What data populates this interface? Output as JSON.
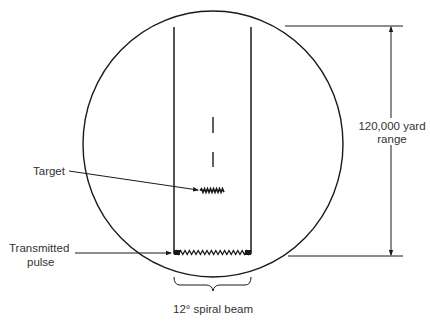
{
  "diagram": {
    "labels": {
      "target": "Target",
      "transmitted_pulse_line1": "Transmitted",
      "transmitted_pulse_line2": "pulse",
      "range_line1": "120,000 yard",
      "range_line2": "range",
      "beam": "12° spiral beam"
    },
    "range_yards": 120000,
    "beam_angle_degrees": 12,
    "colors": {
      "ink": "#1a1a1a",
      "text": "#333333",
      "background": "#ffffff"
    }
  }
}
